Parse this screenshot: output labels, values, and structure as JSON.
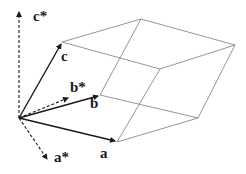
{
  "diagram": {
    "type": "unit cell with real and reciprocal lattice vectors",
    "colors": {
      "edges": "#8a8a8a",
      "vectors": "#1a1a1a",
      "background": "#ffffff"
    },
    "origin": [
      19,
      118
    ],
    "real_vectors": [
      {
        "name": "a",
        "label": "a",
        "tip": [
          117,
          142
        ]
      },
      {
        "name": "b",
        "label": "b",
        "tip": [
          100,
          95
        ]
      },
      {
        "name": "c",
        "label": "c",
        "tip": [
          62,
          42
        ]
      }
    ],
    "reciprocal_vectors": [
      {
        "name": "a-star",
        "label": "a*",
        "tip": [
          48,
          161
        ]
      },
      {
        "name": "b-star",
        "label": "b*",
        "tip": [
          70,
          97
        ]
      },
      {
        "name": "c-star",
        "label": "c*",
        "tip": [
          19,
          10
        ]
      }
    ]
  }
}
